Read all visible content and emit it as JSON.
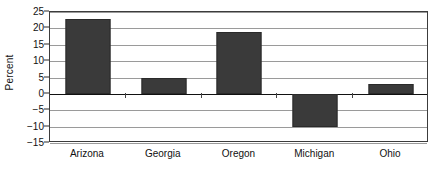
{
  "chart_data": {
    "type": "bar",
    "title": "",
    "subtitle": "",
    "xlabel": "",
    "ylabel": "Percent",
    "categories": [
      "Arizona",
      "Georgia",
      "Oregon",
      "Michigan",
      "Ohio"
    ],
    "values": [
      23,
      5,
      19,
      -10,
      3
    ],
    "series": [
      {
        "name": "Percent",
        "values": [
          23,
          5,
          19,
          -10,
          3
        ]
      }
    ],
    "ylim": [
      -15,
      25
    ],
    "y_ticks": [
      25,
      20,
      15,
      10,
      5,
      0,
      "−5",
      "−10",
      "−15"
    ],
    "y_tick_values": [
      25,
      20,
      15,
      10,
      5,
      0,
      -5,
      -10,
      -15
    ],
    "grid": true,
    "legend": false,
    "legend_position": "none",
    "bar_color": "#3a3a3a",
    "gridline_color": "#9a9a9a",
    "axis_color": "#3c3c3c",
    "zero_line_color": "#111111",
    "background_color": "#ffffff",
    "text_color": "#111111"
  }
}
